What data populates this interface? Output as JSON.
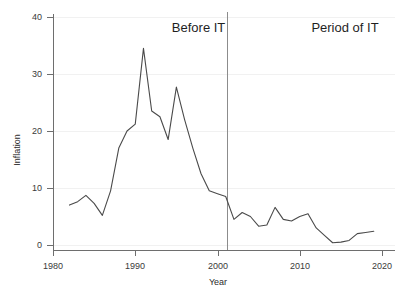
{
  "chart_data": {
    "type": "line",
    "title": "",
    "xlabel": "Year",
    "ylabel": "Inflation",
    "xlim": [
      1978,
      2020.5
    ],
    "ylim": [
      -1.5,
      42
    ],
    "grid": true,
    "legend_position": "none",
    "x_ticks": [
      1980,
      1990,
      2000,
      2010,
      2020
    ],
    "x_tick_labels": [
      "1980",
      "1990",
      "2000",
      "2010",
      "2020"
    ],
    "y_ticks": [
      0,
      10,
      20,
      30,
      40
    ],
    "y_tick_labels": [
      "0",
      "10",
      "20",
      "30",
      "40"
    ],
    "series": [
      {
        "name": "Inflation",
        "color": "#4a4a4a",
        "x": [
          1982,
          1983,
          1984,
          1985,
          1986,
          1987,
          1988,
          1989,
          1990,
          1991,
          1992,
          1993,
          1994,
          1995,
          1996,
          1997,
          1998,
          1999,
          2000,
          2001,
          2002,
          2003,
          2004,
          2005,
          2006,
          2007,
          2008,
          2009,
          2010,
          2011,
          2012,
          2013,
          2014,
          2015,
          2016,
          2017,
          2018,
          2019
        ],
        "values": [
          7.0,
          7.6,
          8.7,
          7.3,
          5.2,
          9.5,
          17.0,
          20.0,
          21.2,
          34.5,
          23.5,
          22.5,
          18.5,
          27.7,
          22.0,
          17.0,
          12.5,
          9.5,
          9.0,
          8.5,
          4.5,
          5.7,
          5.0,
          3.3,
          3.5,
          6.6,
          4.5,
          4.2,
          5.0,
          5.5,
          3.0,
          1.7,
          0.4,
          0.5,
          0.8,
          2.0,
          2.2,
          2.4
        ],
        "value_unit": "percent"
      }
    ],
    "annotations": [
      {
        "name": "before-it-label",
        "text": "Before IT",
        "x_center_year": 1997.7,
        "y_value": 38.0
      },
      {
        "name": "period-of-it-label",
        "text": "Period of IT",
        "x_center_year": 2015.5,
        "y_value": 38.0
      },
      {
        "name": "regime-divider",
        "type": "vline",
        "x_year": 2001.2,
        "color": "#8c8c8c"
      }
    ]
  }
}
